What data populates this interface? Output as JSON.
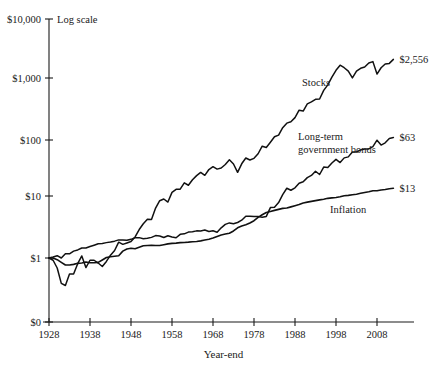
{
  "chart_data": {
    "type": "line",
    "title": "",
    "subtitle": "",
    "scale_note": "Log scale",
    "xlabel": "Year-end",
    "ylabel": "",
    "grid": false,
    "legend_position": "inline-labels",
    "xlim": [
      1928,
      2012
    ],
    "ylim": [
      1,
      10000
    ],
    "y_log": true,
    "xticks": [
      1928,
      1938,
      1948,
      1958,
      1968,
      1978,
      1988,
      1998,
      2008
    ],
    "xtick_labels": [
      "1928",
      "1938",
      "1948",
      "1958",
      "1968",
      "1978",
      "1988",
      "1998",
      "2008"
    ],
    "yticks": [
      0,
      1,
      10,
      100,
      1000,
      10000
    ],
    "ytick_labels": [
      "$0",
      "$1",
      "$10",
      "$100",
      "$1,000",
      "$10,000"
    ],
    "series": [
      {
        "name": "Stocks",
        "label": "Stocks",
        "end_label": "$2,556",
        "end_value": 2556,
        "color": "#111111",
        "x": [
          1928,
          1929,
          1930,
          1931,
          1932,
          1933,
          1934,
          1935,
          1936,
          1937,
          1938,
          1939,
          1940,
          1941,
          1942,
          1943,
          1944,
          1945,
          1946,
          1947,
          1948,
          1949,
          1950,
          1951,
          1952,
          1953,
          1954,
          1955,
          1956,
          1957,
          1958,
          1959,
          1960,
          1961,
          1962,
          1963,
          1964,
          1965,
          1966,
          1967,
          1968,
          1969,
          1970,
          1971,
          1972,
          1973,
          1974,
          1975,
          1976,
          1977,
          1978,
          1979,
          1980,
          1981,
          1982,
          1983,
          1984,
          1985,
          1986,
          1987,
          1988,
          1989,
          1990,
          1991,
          1992,
          1993,
          1994,
          1995,
          1996,
          1997,
          1998,
          1999,
          2000,
          2001,
          2002,
          2003,
          2004,
          2005,
          2006,
          2007,
          2008,
          2009,
          2010,
          2011,
          2012
        ],
        "values": [
          1,
          0.92,
          0.69,
          0.39,
          0.36,
          0.55,
          0.55,
          0.81,
          1.08,
          0.7,
          0.92,
          0.92,
          0.83,
          0.73,
          0.88,
          1.11,
          1.32,
          1.8,
          1.66,
          1.75,
          1.84,
          2.19,
          2.88,
          3.57,
          4.22,
          4.18,
          6.38,
          8.39,
          8.94,
          7.98,
          11.44,
          12.81,
          12.87,
          16.32,
          14.9,
          18.29,
          21.32,
          23.98,
          21.56,
          26.73,
          29.67,
          27.14,
          28.24,
          32.28,
          38.39,
          32.77,
          24.1,
          33.07,
          40.97,
          38.04,
          40.52,
          48.02,
          63.62,
          60.48,
          73.52,
          90.15,
          95.83,
          126.24,
          149.76,
          157.64,
          183.76,
          241.95,
          234.41,
          305.94,
          329.24,
          362.45,
          367.21,
          505.18,
          621.07,
          828.38,
          1065.2,
          1289.16,
          1171.54,
          1032.63,
          804.41,
          1035.01,
          1147.83,
          1204.03,
          1394.18,
          1470.33,
          926.41,
          1171.42,
          1347.88,
          1376.53,
          1596.53
        ]
      },
      {
        "name": "Long-term government bonds",
        "label": "Long-term\ngovernment bonds",
        "end_label": "$63",
        "end_value": 63,
        "color": "#111111",
        "x": [
          1928,
          1929,
          1930,
          1931,
          1932,
          1933,
          1934,
          1935,
          1936,
          1937,
          1938,
          1939,
          1940,
          1941,
          1942,
          1943,
          1944,
          1945,
          1946,
          1947,
          1948,
          1949,
          1950,
          1951,
          1952,
          1953,
          1954,
          1955,
          1956,
          1957,
          1958,
          1959,
          1960,
          1961,
          1962,
          1963,
          1964,
          1965,
          1966,
          1967,
          1968,
          1969,
          1970,
          1971,
          1972,
          1973,
          1974,
          1975,
          1976,
          1977,
          1978,
          1979,
          1980,
          1981,
          1982,
          1983,
          1984,
          1985,
          1986,
          1987,
          1988,
          1989,
          1990,
          1991,
          1992,
          1993,
          1994,
          1995,
          1996,
          1997,
          1998,
          1999,
          2000,
          2001,
          2002,
          2003,
          2004,
          2005,
          2006,
          2007,
          2008,
          2009,
          2010,
          2011,
          2012
        ],
        "values": [
          1,
          1.04,
          1.09,
          1.0,
          1.17,
          1.17,
          1.29,
          1.35,
          1.45,
          1.45,
          1.53,
          1.61,
          1.7,
          1.72,
          1.77,
          1.81,
          1.87,
          1.96,
          1.96,
          1.93,
          2.0,
          2.13,
          2.13,
          2.05,
          2.08,
          2.15,
          2.3,
          2.27,
          2.14,
          2.29,
          2.18,
          2.12,
          2.41,
          2.45,
          2.62,
          2.65,
          2.74,
          2.73,
          2.82,
          2.68,
          2.75,
          2.61,
          3.07,
          3.48,
          3.68,
          3.58,
          3.74,
          4.07,
          4.7,
          4.73,
          4.67,
          4.68,
          4.55,
          4.69,
          6.51,
          6.59,
          7.83,
          10.51,
          13.33,
          12.37,
          13.53,
          16.06,
          16.95,
          19.8,
          21.47,
          25.11,
          22.21,
          29.24,
          28.9,
          34.08,
          39.01,
          34.65,
          41.21,
          42.73,
          51.16,
          51.33,
          55.38,
          57.04,
          57.4,
          62.63,
          79.45,
          66.37,
          71.95,
          84.59,
          87.67
        ]
      },
      {
        "name": "Inflation",
        "label": "Inflation",
        "end_label": "$13",
        "end_value": 13,
        "color": "#111111",
        "x": [
          1928,
          1929,
          1930,
          1931,
          1932,
          1933,
          1934,
          1935,
          1936,
          1937,
          1938,
          1939,
          1940,
          1941,
          1942,
          1943,
          1944,
          1945,
          1946,
          1947,
          1948,
          1949,
          1950,
          1951,
          1952,
          1953,
          1954,
          1955,
          1956,
          1957,
          1958,
          1959,
          1960,
          1961,
          1962,
          1963,
          1964,
          1965,
          1966,
          1967,
          1968,
          1969,
          1970,
          1971,
          1972,
          1973,
          1974,
          1975,
          1976,
          1977,
          1978,
          1979,
          1980,
          1981,
          1982,
          1983,
          1984,
          1985,
          1986,
          1987,
          1988,
          1989,
          1990,
          1991,
          1992,
          1993,
          1994,
          1995,
          1996,
          1997,
          1998,
          1999,
          2000,
          2001,
          2002,
          2003,
          2004,
          2005,
          2006,
          2007,
          2008,
          2009,
          2010,
          2011,
          2012
        ],
        "values": [
          1,
          1.0,
          0.94,
          0.85,
          0.77,
          0.77,
          0.79,
          0.82,
          0.83,
          0.86,
          0.84,
          0.84,
          0.85,
          0.93,
          1.02,
          1.05,
          1.07,
          1.09,
          1.29,
          1.4,
          1.44,
          1.41,
          1.49,
          1.58,
          1.59,
          1.6,
          1.59,
          1.59,
          1.64,
          1.69,
          1.72,
          1.74,
          1.77,
          1.78,
          1.8,
          1.83,
          1.85,
          1.89,
          1.95,
          2.01,
          2.1,
          2.23,
          2.35,
          2.43,
          2.51,
          2.73,
          3.07,
          3.28,
          3.44,
          3.67,
          3.99,
          4.52,
          4.98,
          5.43,
          5.64,
          5.86,
          6.09,
          6.32,
          6.39,
          6.68,
          6.97,
          7.29,
          7.73,
          7.97,
          8.2,
          8.43,
          8.65,
          8.87,
          9.17,
          9.33,
          9.48,
          9.73,
          10.07,
          10.24,
          10.49,
          10.69,
          11.04,
          11.41,
          11.69,
          12.17,
          12.18,
          12.52,
          12.71,
          13.09,
          13.31
        ]
      }
    ],
    "annotations": [
      {
        "name": "log-scale-note",
        "text": "Log scale"
      },
      {
        "name": "x-axis-title",
        "text": "Year-end"
      }
    ]
  }
}
